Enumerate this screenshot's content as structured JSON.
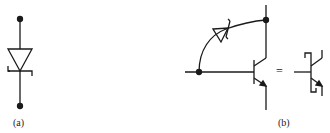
{
  "figure": {
    "panels": [
      {
        "id": "a",
        "label": "(a)",
        "description": "Schottky diode symbol"
      },
      {
        "id": "b",
        "label": "(b)",
        "description": "Schottky-clamped transistor and its equivalent symbol"
      }
    ],
    "equals_sign": "="
  },
  "colors": {
    "stroke": "#1a1a1a",
    "background": "#ffffff"
  }
}
